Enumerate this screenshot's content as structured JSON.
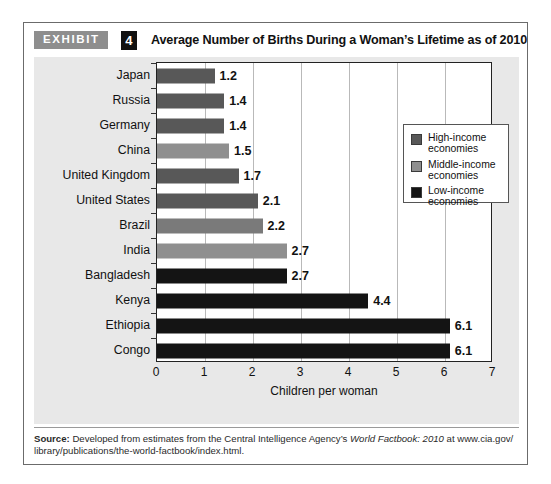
{
  "exhibit": {
    "tag": "EXHIBIT",
    "number": "4",
    "title": "Average Number of Births During a Woman’s Lifetime as of 2010"
  },
  "legend": {
    "items": [
      {
        "label_line1": "High-income",
        "label_line2": "economies",
        "color": "#585858"
      },
      {
        "label_line1": "Middle-income",
        "label_line2": "economies",
        "color": "#8f8f8f"
      },
      {
        "label_line1": "Low-income",
        "label_line2": "economies",
        "color": "#141414"
      }
    ]
  },
  "source": {
    "label": "Source:",
    "text_before_italic": " Developed from estimates from the Central Intelligence Agency’s ",
    "italic_text": "World Factbook: 2010",
    "text_after_italic": " at www.cia.gov/ library/publications/the-world-factbook/index.html."
  },
  "chart_data": {
    "type": "bar",
    "orientation": "horizontal",
    "title": "Average Number of Births During a Woman’s Lifetime as of 2010",
    "xlabel": "Children per woman",
    "ylabel": "",
    "xlim": [
      0,
      7
    ],
    "xticks": [
      0,
      1,
      2,
      3,
      4,
      5,
      6,
      7
    ],
    "grid": true,
    "legend_position": "inside-right-top",
    "categories": [
      "Japan",
      "Russia",
      "Germany",
      "China",
      "United Kingdom",
      "United States",
      "Brazil",
      "India",
      "Bangladesh",
      "Kenya",
      "Ethiopia",
      "Congo"
    ],
    "values": [
      1.2,
      1.4,
      1.4,
      1.5,
      1.7,
      2.1,
      2.2,
      2.7,
      2.7,
      4.4,
      6.1,
      6.1
    ],
    "value_labels": [
      "1.2",
      "1.4",
      "1.4",
      "1.5",
      "1.7",
      "2.1",
      "2.2",
      "2.7",
      "2.7",
      "4.4",
      "6.1",
      "6.1"
    ],
    "groups": [
      "High-income economies",
      "High-income economies",
      "High-income economies",
      "Middle-income economies",
      "High-income economies",
      "High-income economies",
      "Middle-income economies",
      "Middle-income economies",
      "Low-income economies",
      "Low-income economies",
      "Low-income economies",
      "Low-income economies"
    ],
    "bar_colors": [
      "#585858",
      "#585858",
      "#585858",
      "#8f8f8f",
      "#585858",
      "#585858",
      "#7a7a7a",
      "#8f8f8f",
      "#141414",
      "#141414",
      "#141414",
      "#141414"
    ]
  }
}
